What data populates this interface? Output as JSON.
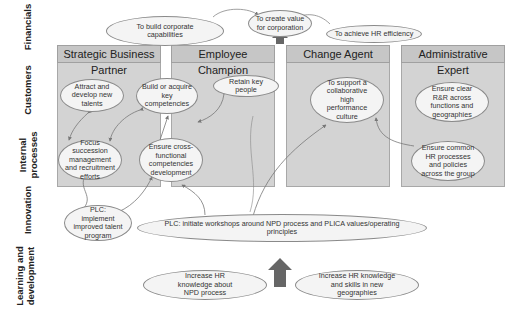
{
  "rows": [
    {
      "label": "Financials"
    },
    {
      "label": "Customers"
    },
    {
      "label": "Internal processes"
    },
    {
      "label": "Innovation"
    },
    {
      "label": "Learning and development"
    }
  ],
  "columns": [
    {
      "title": "Strategic Business Partner"
    },
    {
      "title": "Employee Champion"
    },
    {
      "title": "Change Agent"
    },
    {
      "title": "Administrative Expert"
    }
  ],
  "financials": {
    "build_capabilities": "To build corporate capabilities",
    "create_value": "To create value for corporation",
    "hr_efficiency": "To achieve HR efficiency"
  },
  "customers": {
    "attract_talents": "Attract and develop new talents",
    "build_competencies": "Build or acquire key competencies",
    "retain_people": "Retain key people",
    "support_culture": "To support a collaborative high performance culture",
    "clear_rr": "Ensure clear R&R across functions and geographies"
  },
  "internal": {
    "focus_succession": "Focus succession management and recruitment efforts",
    "cross_functional": "Ensure cross-functional competencies development",
    "common_hr": "Ensure common HR processes and policies across the group"
  },
  "innovation": {
    "plc_talent": "PLC: implement improved talent program",
    "plc_workshops": "PLC: initiate workshops around NPD process and PLICA values/operating principles"
  },
  "learning": {
    "npd_knowledge": "Increase HR knowledge about NPD process",
    "geographies_knowledge": "Increase HR knowledge and skills in new geographies"
  },
  "colors": {
    "column_fill": "#d3d3d3",
    "ellipse_fill": "#f4f4f4",
    "arrow": "#777777",
    "big_arrow": "#666666"
  }
}
